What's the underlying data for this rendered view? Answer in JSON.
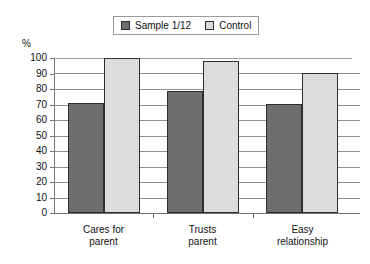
{
  "chart_data": {
    "type": "bar",
    "title": "",
    "xlabel": "",
    "ylabel": "%",
    "ylim": [
      0,
      100
    ],
    "ytick_step": 10,
    "yticks": [
      "100",
      "90",
      "80",
      "70",
      "60",
      "50",
      "40",
      "30",
      "20",
      "10",
      "0"
    ],
    "grid": true,
    "legend_position": "top-center",
    "categories": [
      "Cares for\nparent",
      "Trusts\nparent",
      "Easy\nrelationship"
    ],
    "series": [
      {
        "name": "Sample 1/12",
        "values": [
          71,
          79,
          70
        ],
        "color": "#6e6e6e"
      },
      {
        "name": "Control",
        "values": [
          100,
          98,
          90
        ],
        "color": "#dcdcdc"
      }
    ]
  },
  "legend": {
    "entries": [
      {
        "label": "Sample 1/12",
        "swatch": "legend-swatch-sample"
      },
      {
        "label": "Control",
        "swatch": "legend-swatch-control"
      }
    ]
  },
  "axis": {
    "unit_label": "%"
  },
  "colors": {
    "series_sample": "#6e6e6e",
    "series_control": "#dcdcdc",
    "bar_outline": "#2e2e2e",
    "gridline": "#8e8e8e",
    "axis": "#6f6f6f",
    "text": "#111111",
    "background": "#ffffff"
  }
}
